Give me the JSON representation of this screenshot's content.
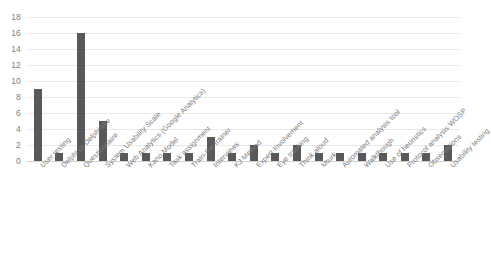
{
  "chart_data": {
    "type": "bar",
    "title": "",
    "xlabel": "",
    "ylabel": "",
    "ylim": [
      0,
      18
    ],
    "y_ticks": [
      0,
      2,
      4,
      6,
      8,
      10,
      12,
      14,
      16,
      18
    ],
    "grid": true,
    "legend": "none",
    "bar_color": "#595959",
    "gridline_color": "#e8e8e8",
    "tick_label_color": "#808080",
    "category_label_color": "#7a7a7a",
    "category_label_rotation": -45,
    "categories": [
      "User testing",
      "Delphi or Delphi-like",
      "Questionnaire",
      "System Usability Scale",
      "Web Analytics (Google Analytics)",
      "Kano Model",
      "Task assignment",
      "Train-the-trainer",
      "Interviews",
      "KJ Method",
      "Expert Involvement",
      "Eye tracking",
      "Think aloud",
      "Mturk",
      "Automated analysis tool",
      "Walkthough",
      "Use of heuristics",
      "Protocol analysis WOSP",
      "Observations",
      "Usability testing"
    ],
    "values": [
      9,
      1,
      16,
      5,
      1,
      1,
      1,
      1,
      3,
      1,
      2,
      1,
      2,
      1,
      1,
      1,
      1,
      1,
      1,
      2
    ]
  }
}
